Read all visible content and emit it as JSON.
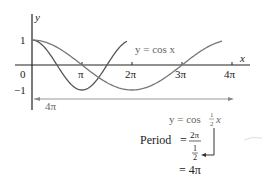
{
  "chart_data": {
    "type": "line",
    "title": "",
    "xlabel": "x",
    "ylabel": "y",
    "xlim": [
      0,
      12.566
    ],
    "ylim": [
      -1,
      1
    ],
    "x_ticks": [
      "0",
      "π",
      "2π",
      "3π",
      "4π"
    ],
    "y_ticks": [
      "1",
      "−1"
    ],
    "grid": false,
    "series": [
      {
        "name": "y = cos x",
        "function": "cos(x)",
        "period": "2π",
        "color": "#555555"
      },
      {
        "name": "y = cos ½x",
        "function": "cos(x/2)",
        "period": "4π",
        "color": "#777777"
      }
    ],
    "annotations": {
      "period_span_label": "4π",
      "cos_x_label": "y = cos x",
      "cos_half_label_prefix": "y = cos",
      "cos_half_label_num": "1",
      "cos_half_label_den": "2",
      "cos_half_label_var": "x",
      "period_word": "Period",
      "equals": "=",
      "period_num": "2π",
      "period_den_num": "1",
      "period_den_den": "2",
      "period_result": "= 4π"
    }
  },
  "colors": {
    "axis": "#222222",
    "cos_x": "#555555",
    "cos_half_x": "#777777",
    "arrow": "#999999"
  }
}
